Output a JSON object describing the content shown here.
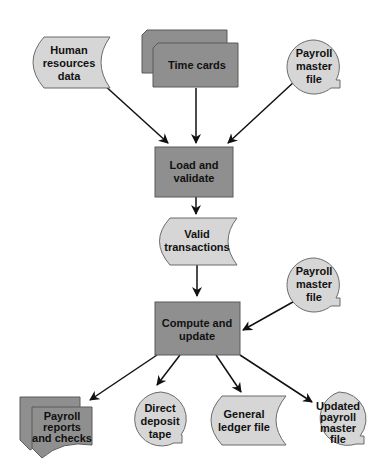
{
  "diagram": {
    "type": "flowchart",
    "colors": {
      "process_fill": "#8f8f8f",
      "data_fill": "#d6d6d6",
      "stroke": "#5a5a5a",
      "arrow": "#111111",
      "background": "#ffffff"
    },
    "nodes": {
      "hr_data": {
        "shape": "stored-data",
        "lines": [
          "Human",
          "resources",
          "data"
        ]
      },
      "time_cards": {
        "shape": "stacked-cards",
        "lines": [
          "Time cards"
        ]
      },
      "payroll_master_in": {
        "shape": "magnetic-tape",
        "lines": [
          "Payroll",
          "master",
          "file"
        ]
      },
      "load_validate": {
        "shape": "process",
        "lines": [
          "Load and",
          "validate"
        ]
      },
      "valid_transactions": {
        "shape": "stored-data",
        "lines": [
          "Valid",
          "transactions"
        ]
      },
      "payroll_master_in2": {
        "shape": "magnetic-tape",
        "lines": [
          "Payroll",
          "master",
          "file"
        ]
      },
      "compute_update": {
        "shape": "process",
        "lines": [
          "Compute and",
          "update"
        ]
      },
      "reports_checks": {
        "shape": "multi-document",
        "lines": [
          "Payroll",
          "reports",
          "and checks"
        ]
      },
      "direct_deposit": {
        "shape": "magnetic-tape",
        "lines": [
          "Direct",
          "deposit",
          "tape"
        ]
      },
      "general_ledger": {
        "shape": "stored-data",
        "lines": [
          "General",
          "ledger file"
        ]
      },
      "updated_master": {
        "shape": "magnetic-tape",
        "lines": [
          "Updated",
          "payroll",
          "master",
          "file"
        ]
      }
    },
    "edges": [
      {
        "from": "Human resources data",
        "to": "Load and validate"
      },
      {
        "from": "Time cards",
        "to": "Load and validate"
      },
      {
        "from": "Payroll master file",
        "to": "Load and validate"
      },
      {
        "from": "Load and validate",
        "to": "Valid transactions"
      },
      {
        "from": "Valid transactions",
        "to": "Compute and update"
      },
      {
        "from": "Payroll master file",
        "to": "Compute and update"
      },
      {
        "from": "Compute and update",
        "to": "Payroll reports and checks"
      },
      {
        "from": "Compute and update",
        "to": "Direct deposit tape"
      },
      {
        "from": "Compute and update",
        "to": "General ledger file"
      },
      {
        "from": "Compute and update",
        "to": "Updated payroll master file"
      }
    ]
  }
}
